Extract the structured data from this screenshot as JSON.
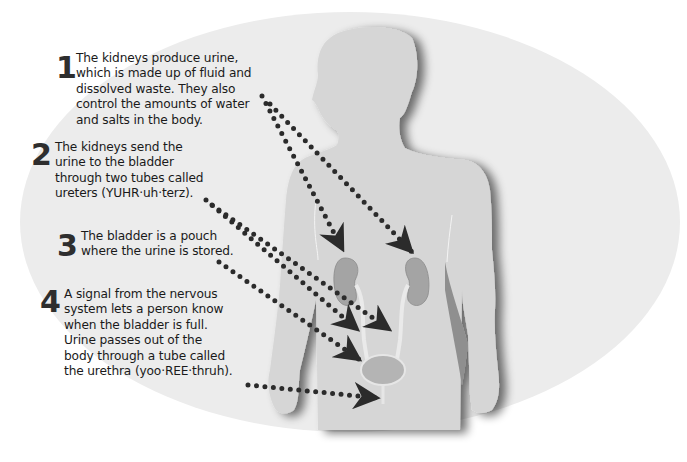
{
  "diagram": {
    "colors": {
      "background": "#ffffff",
      "ellipse": "#ececec",
      "body": "#d6d6d6",
      "body_shadow": "#9a9a9a",
      "kidney": "#a8a8a8",
      "bladder": "#b5b5b5",
      "dots": "#2b2b2b",
      "text": "#1a1a1a"
    },
    "steps": [
      {
        "number": "1",
        "text": "The kidneys produce urine,\nwhich is made up of fluid and\ndissolved waste. They also\ncontrol the amounts of water\nand salts in the body.",
        "points_to": [
          "left kidney",
          "right kidney"
        ]
      },
      {
        "number": "2",
        "text": "The kidneys send the\nurine to the bladder\nthrough two tubes called\nureters (YUHR·uh·terz).",
        "points_to": [
          "left ureter",
          "right ureter"
        ]
      },
      {
        "number": "3",
        "text": "The bladder is a pouch\nwhere the urine is stored.",
        "points_to": [
          "bladder"
        ]
      },
      {
        "number": "4",
        "text": "A signal from the nervous\nsystem lets a person know\nwhen the bladder is full.\nUrine passes out of the\nbody through a tube called\nthe urethra (yoo·REE·thruh).",
        "points_to": [
          "urethra"
        ]
      }
    ],
    "parts": [
      "left kidney",
      "right kidney",
      "ureters",
      "bladder",
      "urethra",
      "body silhouette"
    ]
  }
}
